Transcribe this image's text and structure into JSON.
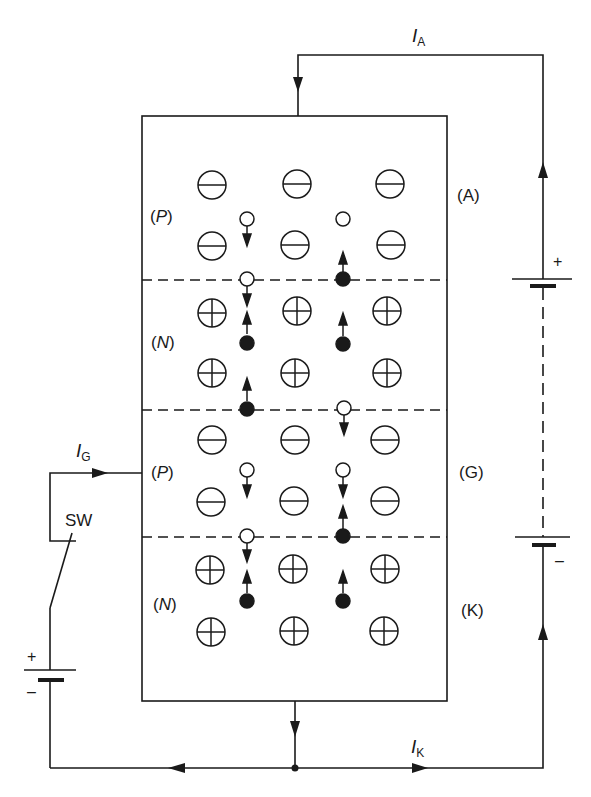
{
  "diagram": {
    "currents": {
      "anode": {
        "symbol": "I",
        "subscript": "A"
      },
      "gate": {
        "symbol": "I",
        "subscript": "G"
      },
      "cathode": {
        "symbol": "I",
        "subscript": "K"
      }
    },
    "terminals": {
      "anode": "(A)",
      "gate": "(G)",
      "cathode": "(K)"
    },
    "layers": [
      {
        "type": "P",
        "label_open": "(",
        "label": "P",
        "label_close": ")",
        "ion": "minus"
      },
      {
        "type": "N",
        "label_open": "(",
        "label": "N",
        "label_close": ")",
        "ion": "plus"
      },
      {
        "type": "P",
        "label_open": "(",
        "label": "P",
        "label_close": ")",
        "ion": "minus"
      },
      {
        "type": "N",
        "label_open": "(",
        "label": "N",
        "label_close": ")",
        "ion": "plus"
      }
    ],
    "switch_label": "SW",
    "battery_signs": {
      "plus": "+",
      "minus": "–"
    },
    "colors": {
      "ink": "#1a1a1a",
      "background": "#ffffff"
    }
  }
}
